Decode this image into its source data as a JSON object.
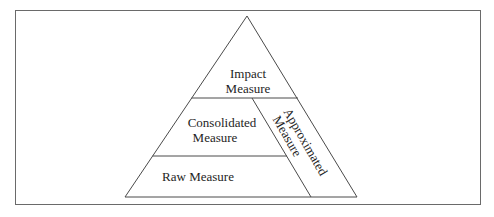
{
  "diagram": {
    "type": "pyramid",
    "colors": {
      "background": "#ffffff",
      "line": "#4a4a4a",
      "frame": "#6a6a6a",
      "text": "#1e1e1e"
    },
    "levels": [
      {
        "id": "impact",
        "lines": [
          "Impact",
          "Measure"
        ]
      },
      {
        "id": "consolidated",
        "lines": [
          "Consolidated",
          "Measure"
        ]
      },
      {
        "id": "raw",
        "lines": [
          "Raw Measure"
        ]
      }
    ],
    "side_region": {
      "id": "approximated",
      "lines": [
        "Approximated",
        "Measure"
      ]
    }
  }
}
